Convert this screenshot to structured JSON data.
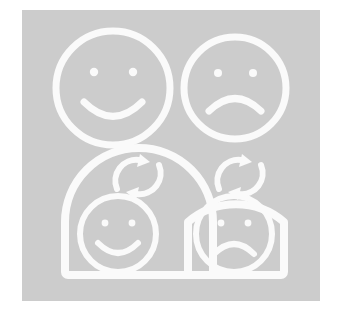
{
  "illustration": {
    "title": "Satisfaction feedback illustration",
    "description": "Two face icons above two arch-shaped cards containing refresh icons and faces",
    "canvas": {
      "width": 340,
      "height": 315,
      "background_color": "#ffffff"
    },
    "panel": {
      "background_color": "#cccccc",
      "x": 22,
      "y": 10,
      "width": 298,
      "height": 291
    },
    "stroke_color": "#fafafa",
    "items": [
      {
        "id": "happy-face-top",
        "name": "happy-face",
        "label": "Happy face",
        "row": 1,
        "column": 1,
        "mood": "happy",
        "shape": "circle",
        "has_card": false,
        "has_refresh": false
      },
      {
        "id": "sad-face-top",
        "name": "sad-face",
        "label": "Sad face",
        "row": 1,
        "column": 2,
        "mood": "sad",
        "shape": "circle",
        "has_card": false,
        "has_refresh": false
      },
      {
        "id": "happy-card-bottom",
        "name": "happy-card",
        "label": "Happy card with refresh",
        "row": 2,
        "column": 1,
        "mood": "happy",
        "shape": "arch",
        "has_card": true,
        "has_refresh": true,
        "refresh_label": "Refresh"
      },
      {
        "id": "sad-card-bottom",
        "name": "sad-card",
        "label": "Sad card with refresh",
        "row": 2,
        "column": 2,
        "mood": "sad",
        "shape": "arch",
        "has_card": true,
        "has_refresh": true,
        "refresh_label": "Refresh"
      }
    ]
  }
}
